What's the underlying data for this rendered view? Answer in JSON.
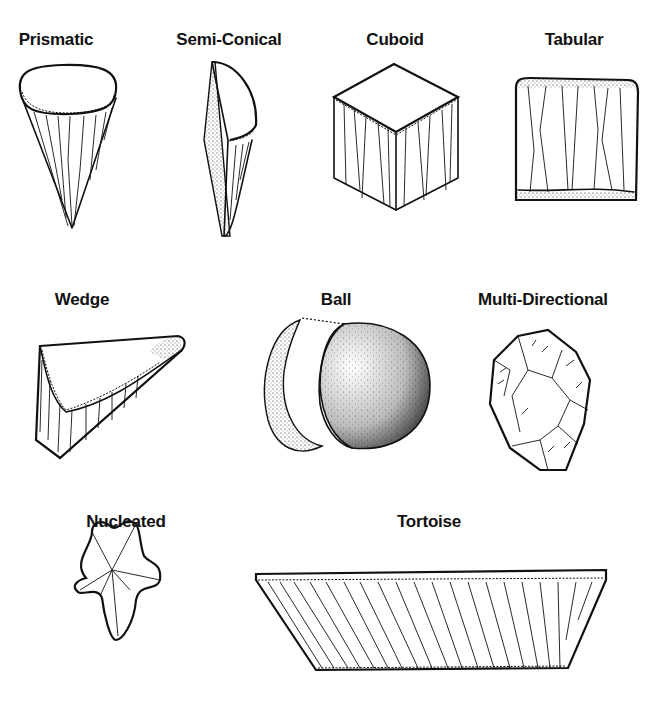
{
  "figure": {
    "background": "#ffffff",
    "ink_color": "#111111",
    "rows": [
      {
        "items": [
          {
            "id": "prismatic",
            "label": "Prismatic",
            "icon": "prismatic-core-drawing",
            "label_x": 56,
            "label_y": 30
          },
          {
            "id": "semi-conical",
            "label": "Semi-Conical",
            "icon": "semi-conical-core-drawing",
            "label_x": 229,
            "label_y": 30
          },
          {
            "id": "cuboid",
            "label": "Cuboid",
            "icon": "cuboid-core-drawing",
            "label_x": 395,
            "label_y": 30
          },
          {
            "id": "tabular",
            "label": "Tabular",
            "icon": "tabular-core-drawing",
            "label_x": 574,
            "label_y": 30
          }
        ]
      },
      {
        "items": [
          {
            "id": "wedge",
            "label": "Wedge",
            "icon": "wedge-core-drawing",
            "label_x": 82,
            "label_y": 290
          },
          {
            "id": "ball",
            "label": "Ball",
            "icon": "ball-core-drawing",
            "label_x": 336,
            "label_y": 290
          },
          {
            "id": "multi-directional",
            "label": "Multi-Directional",
            "icon": "multi-directional-core-drawing",
            "label_x": 543,
            "label_y": 290
          }
        ]
      },
      {
        "items": [
          {
            "id": "nucleated",
            "label": "Nucleated",
            "icon": "nucleated-core-drawing",
            "label_x": 126,
            "label_y": 512
          },
          {
            "id": "tortoise",
            "label": "Tortoise",
            "icon": "tortoise-core-drawing",
            "label_x": 429,
            "label_y": 512
          }
        ]
      }
    ]
  }
}
